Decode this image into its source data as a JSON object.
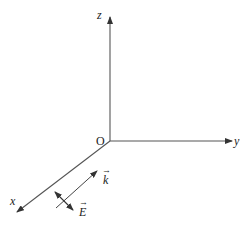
{
  "diagram": {
    "type": "3d-coordinate-axes",
    "colors": {
      "line": "#333333",
      "text": "#222222",
      "background": "#ffffff"
    },
    "origin": {
      "label": "O",
      "x": 110,
      "y": 141
    },
    "axes": {
      "z": {
        "label": "z",
        "end": [
          110,
          17
        ]
      },
      "y": {
        "label": "y",
        "end": [
          232,
          141
        ]
      },
      "x": {
        "label": "x",
        "end": [
          17,
          212
        ]
      }
    },
    "vectors": {
      "k": {
        "label": "k",
        "arrow": "→",
        "description": "wave vector, parallel to x-y plane direction opposite x axis"
      },
      "E": {
        "label": "E",
        "arrow": "→",
        "description": "electric field, perpendicular to k (double-headed)"
      }
    }
  }
}
